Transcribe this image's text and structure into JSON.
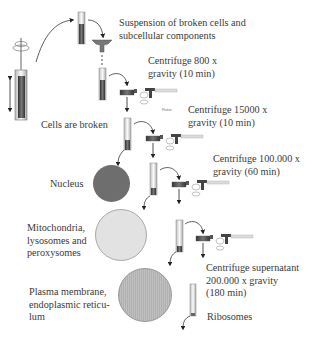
{
  "steps": {
    "suspension": "Suspension of broken cells and subcellular components",
    "suspension_line1": "Suspension of broken cells and",
    "suspension_line2": "subcellular components",
    "cells_broken": "Cells are broken",
    "step1_line1": "Centrifuge 800 x",
    "step1_line2": "gravity (10 min)",
    "step2_line1": "Centrifuge 15000 x",
    "step2_line2": "gravity (10 min)",
    "step3_line1": "Centrifuge 100.000 x",
    "step3_line2": "gravity (60 min)",
    "step4_line1": "Centrifuge supernatant",
    "step4_line2": "200.000 x gravity",
    "step4_line3": "(180 min)",
    "rotor_label": "Rotor"
  },
  "fractions": [
    {
      "label_lines": [
        "Nucleus"
      ],
      "color": "#6e6e6e"
    },
    {
      "label_lines": [
        "Mitochondria,",
        "lysosomes and",
        "peroxysomes"
      ],
      "color": "#e2e2e2"
    },
    {
      "label_lines": [
        "Plasma membrane,",
        "endoplasmic reticu-",
        "lum"
      ],
      "color": "#b8b8b8"
    },
    {
      "label_lines": [
        "Ribosomes"
      ],
      "color": "#ffffff"
    }
  ]
}
